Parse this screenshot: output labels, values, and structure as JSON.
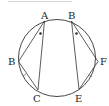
{
  "diagram": {
    "type": "circle-chords",
    "colors": {
      "stroke": "#333333",
      "top_rule": "#d8d8d8",
      "label": "#222222"
    },
    "labels": {
      "A": "A",
      "B_top": "B",
      "B_left": "B",
      "F": "F",
      "C": "C",
      "E": "E"
    },
    "chords": [
      "A-B_left",
      "A-C",
      "B_top-F",
      "B_top-E",
      "B_left-C",
      "E-F"
    ],
    "angle_marks": [
      "dot at A",
      "dot at B_top"
    ],
    "equal_marks": [
      "arc B_left-C",
      "arc E-F"
    ]
  }
}
